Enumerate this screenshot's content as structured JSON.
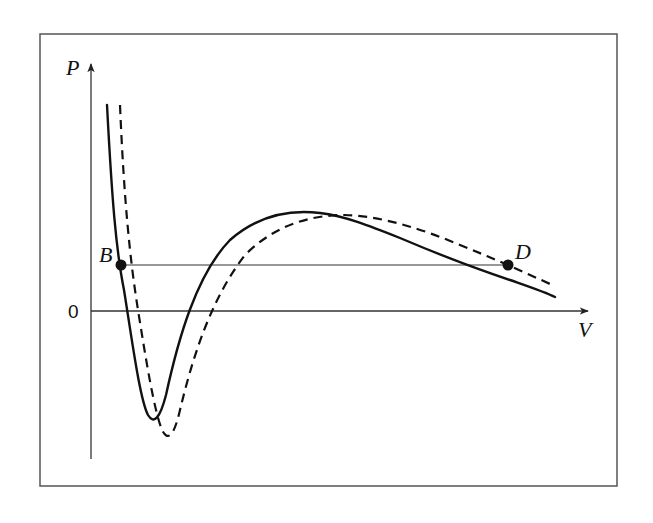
{
  "diagram": {
    "axes": {
      "y_label": "P",
      "x_label": "V",
      "origin_label": "0"
    },
    "points": [
      {
        "label": "B",
        "description": "intersection of horizontal line with solid curve on left branch"
      },
      {
        "label": "D",
        "description": "intersection of horizontal line with dashed curve on right branch"
      }
    ],
    "curves": [
      {
        "name": "solid-isotherm",
        "style": "solid"
      },
      {
        "name": "dashed-isotherm",
        "style": "dashed"
      }
    ],
    "horizontal_line": {
      "from": "B",
      "to": "D"
    },
    "colors": {
      "line": "#111111",
      "frame": "#555555",
      "background": "#ffffff"
    }
  }
}
